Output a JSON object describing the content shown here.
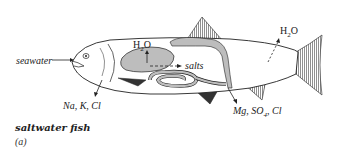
{
  "figure": {
    "caption": "saltwater fish",
    "panel": "(a)",
    "labels": {
      "seawater": "seawater",
      "h2o_inner": "H",
      "h2o_inner_sub": "2",
      "h2o_inner_tail": "O",
      "h2o_outer": "H",
      "h2o_outer_sub": "2",
      "h2o_outer_tail": "O",
      "salts": "salts",
      "gill_ions": "Na, K, Cl",
      "kidney_ions_a": "Mg, SO",
      "kidney_ions_sub": "4",
      "kidney_ions_b": ", Cl"
    }
  }
}
